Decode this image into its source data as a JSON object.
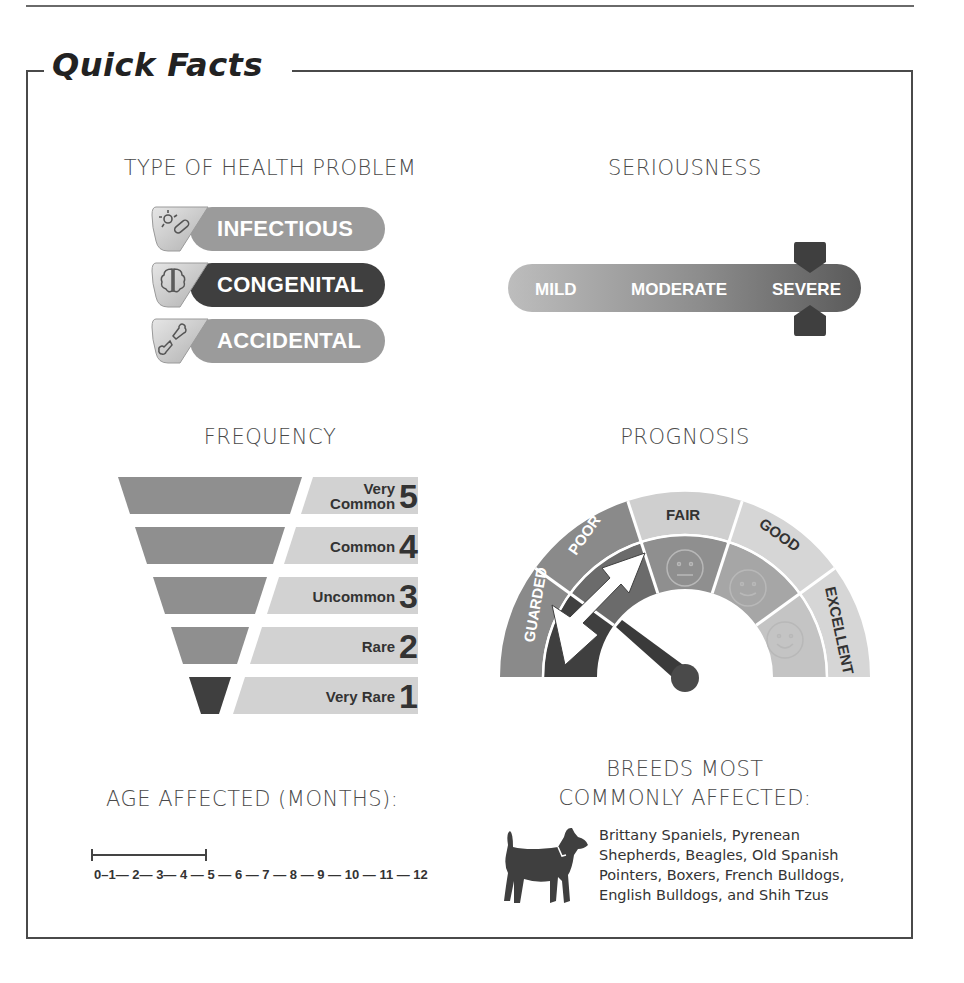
{
  "title": "Quick Facts",
  "type_of_health_problem": {
    "heading": "TYPE OF HEALTH PROBLEM",
    "items": [
      {
        "label": "INFECTIOUS",
        "icon": "germ-icon",
        "selected": false
      },
      {
        "label": "CONGENITAL",
        "icon": "brain-icon",
        "selected": true
      },
      {
        "label": "ACCIDENTAL",
        "icon": "broken-bone-icon",
        "selected": false
      }
    ]
  },
  "seriousness": {
    "heading": "SERIOUSNESS",
    "levels": [
      "MILD",
      "MODERATE",
      "SEVERE"
    ],
    "selected": "SEVERE"
  },
  "frequency": {
    "heading": "FREQUENCY",
    "levels": [
      {
        "label_line1": "Very",
        "label_line2": "Common",
        "number": "5",
        "selected": false
      },
      {
        "label_line1": "",
        "label_line2": "Common",
        "number": "4",
        "selected": false
      },
      {
        "label_line1": "",
        "label_line2": "Uncommon",
        "number": "3",
        "selected": false
      },
      {
        "label_line1": "",
        "label_line2": "Rare",
        "number": "2",
        "selected": false
      },
      {
        "label_line1": "",
        "label_line2": "Very Rare",
        "number": "1",
        "selected": true
      }
    ]
  },
  "prognosis": {
    "heading": "PROGNOSIS",
    "levels": [
      "GUARDED",
      "POOR",
      "FAIR",
      "GOOD",
      "EXCELLENT"
    ],
    "selected_range": [
      "GUARDED",
      "POOR"
    ]
  },
  "age_affected": {
    "heading": "AGE AFFECTED (MONTHS):",
    "scale": "0–1— 2— 3— 4 — 5 — 6 — 7 — 8 — 9 —  10 — 11 — 12",
    "range_start": 0,
    "range_end": 4
  },
  "breeds": {
    "heading_line1": "BREEDS MOST",
    "heading_line2": "COMMONLY AFFECTED:",
    "lines": [
      "Brittany Spaniels, Pyrenean",
      "Shepherds, Beagles, Old Spanish",
      "Pointers, Boxers, French Bulldogs,",
      "English Bulldogs, and Shih Tzus"
    ],
    "icon": "dog-icon"
  },
  "colors": {
    "dark": "#3f3f3f",
    "mid": "#8f8f8f",
    "light": "#c8c8c8",
    "border": "#4a4a4a"
  }
}
